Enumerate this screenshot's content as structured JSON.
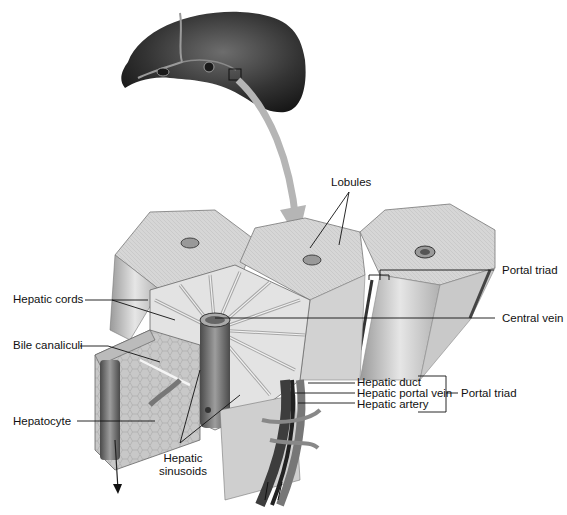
{
  "figure": {
    "overview": "Liver (whole organ) with magnified region indicated by square",
    "labels": {
      "lobules": "Lobules",
      "portal_triad_top": "Portal triad",
      "hepatic_cords": "Hepatic cords",
      "central_vein": "Central vein",
      "bile_canaliculi": "Bile canaliculi",
      "hepatic_duct": "Hepatic duct",
      "hepatic_portal_vein": "Hepatic portal vein",
      "hepatic_artery": "Hepatic artery",
      "portal_triad_group": "Portal triad",
      "hepatocyte": "Hepatocyte",
      "hepatic_sinusoids_line1": "Hepatic",
      "hepatic_sinusoids_line2": "sinusoids"
    },
    "colors": {
      "background": "#ffffff",
      "liver_dark": "#2a2a2a",
      "lobule_light": "#d8d8d8",
      "lobule_mid": "#bdbdbd",
      "vessel": "#6e6e6e",
      "arrow": "#b5b5b5",
      "leader_line": "#111111"
    }
  }
}
